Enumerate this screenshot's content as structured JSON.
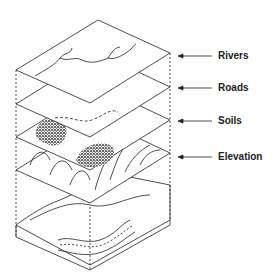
{
  "layers": [
    {
      "label": "Rivers",
      "y": 56
    },
    {
      "label": "Roads",
      "y": 88
    },
    {
      "label": "Soils",
      "y": 121
    },
    {
      "label": "Elevation",
      "y": 157
    }
  ]
}
